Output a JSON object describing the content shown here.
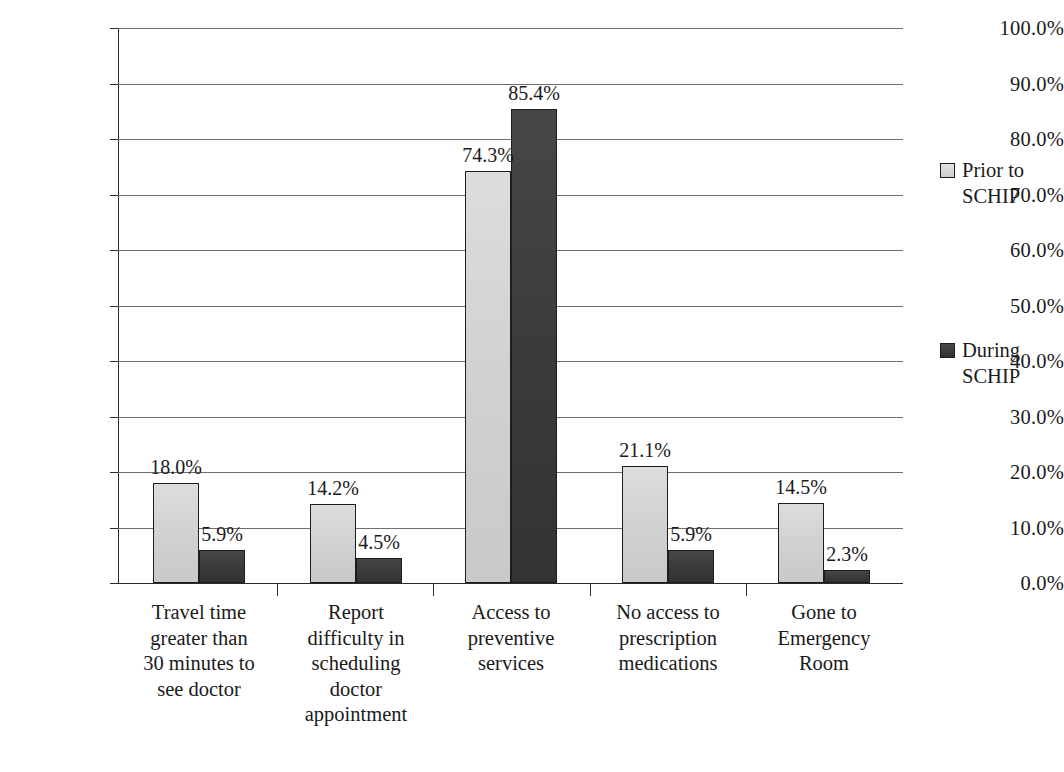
{
  "chart_data": {
    "type": "bar",
    "title": "",
    "xlabel": "",
    "ylabel": "",
    "ylim": [
      0,
      100
    ],
    "grid": true,
    "legend_position": "right",
    "ytick_labels": [
      "100.0%",
      "90.0%",
      "80.0%",
      "70.0%",
      "60.0%",
      "50.0%",
      "40.0%",
      "30.0%",
      "20.0%",
      "10.0%",
      "0.0%"
    ],
    "ytick_values": [
      100,
      90,
      80,
      70,
      60,
      50,
      40,
      30,
      20,
      10,
      0
    ],
    "categories": [
      "Travel time\ngreater than\n30 minutes to\nsee doctor",
      "Report\ndifficulty in\nscheduling\ndoctor\nappointment",
      "Access to\npreventive\nservices",
      "No access to\nprescription\nmedications",
      "Gone to\nEmergency\nRoom"
    ],
    "series": [
      {
        "name": "Prior to\nSCHIP",
        "color": "#d4d4d4",
        "values": [
          18.0,
          14.2,
          74.3,
          21.1,
          14.5
        ],
        "value_labels": [
          "18.0%",
          "14.2%",
          "74.3%",
          "21.1%",
          "14.5%"
        ]
      },
      {
        "name": "During\nSCHIP",
        "color": "#3d3d3d",
        "values": [
          5.9,
          4.5,
          85.4,
          5.9,
          2.3
        ],
        "value_labels": [
          "5.9%",
          "4.5%",
          "85.4%",
          "5.9%",
          "2.3%"
        ]
      }
    ]
  }
}
